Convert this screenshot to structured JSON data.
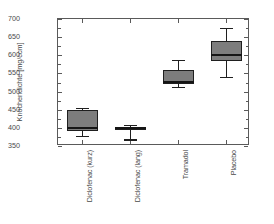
{
  "chart_data": {
    "type": "box",
    "title": "",
    "xlabel": "",
    "ylabel": "Knochendichte [mg/ccm]",
    "ylim": [
      350,
      700
    ],
    "ytick_step": 50,
    "yticks": [
      350,
      400,
      450,
      500,
      550,
      600,
      650,
      700
    ],
    "ytick_labels": [
      "350",
      "400",
      "450",
      "500",
      "550",
      "600",
      "650",
      "700"
    ],
    "minor_ticks": true,
    "grid": false,
    "legend": null,
    "categories": [
      "Diclofenac (kurz)",
      "Diclofenac (lang)",
      "Tramadol",
      "Placebo"
    ],
    "boxes": [
      {
        "category": "Diclofenac (kurz)",
        "whisker_low": 378,
        "q1": 392,
        "median": 400,
        "q3": 450,
        "whisker_high": 456
      },
      {
        "category": "Diclofenac (lang)",
        "whisker_low": 368,
        "q1": 395,
        "median": 399,
        "q3": 403,
        "whisker_high": 408
      },
      {
        "category": "Tramadol",
        "whisker_low": 513,
        "q1": 521,
        "median": 527,
        "q3": 560,
        "whisker_high": 587
      },
      {
        "category": "Placebo",
        "whisker_low": 540,
        "q1": 584,
        "median": 601,
        "q3": 640,
        "whisker_high": 676
      }
    ],
    "colors": {
      "box_fill": "#7d7d7d",
      "box_edge": "#1f1f1f",
      "median": "#151515",
      "axis": "#5a5a5a",
      "text": "#4a4a4a",
      "background": "#ffffff"
    }
  }
}
